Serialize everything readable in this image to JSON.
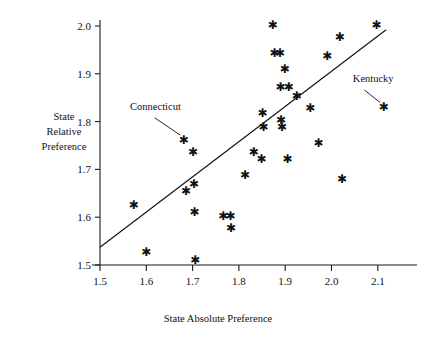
{
  "chart_data": {
    "type": "scatter",
    "title": "",
    "xlabel": "State Absolute Preference",
    "ylabel": "State Relative Preference",
    "ylabel_lines": [
      "State",
      "Relative",
      "Preference"
    ],
    "xlim": [
      1.5,
      2.13
    ],
    "ylim": [
      1.5,
      2.02
    ],
    "xticks": [
      1.5,
      1.6,
      1.7,
      1.8,
      1.9,
      2.0,
      2.1
    ],
    "xticklabels": [
      "1.5",
      "1.6",
      "1.7",
      "1.8",
      "1.9",
      "2.0",
      "2.1"
    ],
    "yticks": [
      1.5,
      1.6,
      1.7,
      1.8,
      1.9,
      2.0
    ],
    "yticklabels": [
      "1.5",
      "1.6",
      "1.7",
      "1.8",
      "1.9",
      "2.0"
    ],
    "grid": false,
    "legend": false,
    "marker": "asterisk",
    "marker_color": "#111111",
    "points": [
      {
        "x": 1.573,
        "y": 1.627
      },
      {
        "x": 1.6,
        "y": 1.529
      },
      {
        "x": 1.681,
        "y": 1.763,
        "label": "Connecticut"
      },
      {
        "x": 1.686,
        "y": 1.655
      },
      {
        "x": 1.701,
        "y": 1.737
      },
      {
        "x": 1.703,
        "y": 1.67
      },
      {
        "x": 1.704,
        "y": 1.611
      },
      {
        "x": 1.706,
        "y": 1.511
      },
      {
        "x": 1.766,
        "y": 1.604
      },
      {
        "x": 1.782,
        "y": 1.604
      },
      {
        "x": 1.783,
        "y": 1.578
      },
      {
        "x": 1.813,
        "y": 1.689
      },
      {
        "x": 1.832,
        "y": 1.737
      },
      {
        "x": 1.849,
        "y": 1.722
      },
      {
        "x": 1.851,
        "y": 1.82
      },
      {
        "x": 1.853,
        "y": 1.789
      },
      {
        "x": 1.873,
        "y": 2.003
      },
      {
        "x": 1.877,
        "y": 1.945
      },
      {
        "x": 1.889,
        "y": 1.945
      },
      {
        "x": 1.89,
        "y": 1.873
      },
      {
        "x": 1.891,
        "y": 1.805
      },
      {
        "x": 1.893,
        "y": 1.79
      },
      {
        "x": 1.899,
        "y": 1.911
      },
      {
        "x": 1.905,
        "y": 1.722
      },
      {
        "x": 1.908,
        "y": 1.873
      },
      {
        "x": 1.925,
        "y": 1.855
      },
      {
        "x": 1.954,
        "y": 1.83
      },
      {
        "x": 1.972,
        "y": 1.756
      },
      {
        "x": 1.991,
        "y": 1.938
      },
      {
        "x": 2.018,
        "y": 1.977
      },
      {
        "x": 2.023,
        "y": 1.68
      },
      {
        "x": 2.097,
        "y": 2.003
      },
      {
        "x": 2.113,
        "y": 1.832,
        "label": "Kentucky"
      }
    ],
    "fit_line": {
      "x0": 1.5,
      "y0": 1.537,
      "x1": 2.118,
      "y1": 1.992
    },
    "annotations": [
      {
        "text": "Connecticut",
        "label_x": 1.565,
        "label_y": 1.824,
        "leader_from_x": 1.618,
        "leader_from_y": 1.808,
        "leader_to_x": 1.673,
        "leader_to_y": 1.772
      },
      {
        "text": "Kentucky",
        "label_x": 2.046,
        "label_y": 1.883,
        "leader_from_x": 2.071,
        "leader_from_y": 1.866,
        "leader_to_x": 2.105,
        "leader_to_y": 1.84
      }
    ]
  }
}
